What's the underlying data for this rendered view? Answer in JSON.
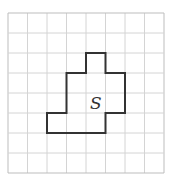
{
  "diagram": {
    "grid": {
      "cols": 8,
      "rows": 8,
      "x0": 8,
      "y0": 13,
      "cell_w": 19.5,
      "cell_h": 20,
      "line_color": "#d4d4d4",
      "border_color": "#bdbdbd"
    },
    "shape": {
      "label": "S",
      "stroke": "#333333",
      "vertices": [
        [
          4,
          2
        ],
        [
          5,
          2
        ],
        [
          5,
          3
        ],
        [
          6,
          3
        ],
        [
          6,
          5
        ],
        [
          5,
          5
        ],
        [
          5,
          6
        ],
        [
          2,
          6
        ],
        [
          2,
          5
        ],
        [
          3,
          5
        ],
        [
          3,
          3
        ],
        [
          4,
          3
        ]
      ]
    }
  }
}
